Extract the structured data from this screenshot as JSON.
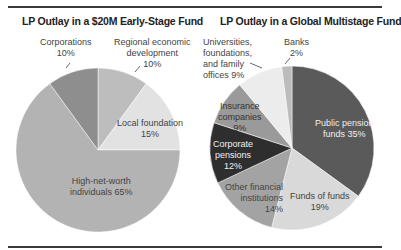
{
  "header": {
    "cut_text": ""
  },
  "chart_data": [
    {
      "type": "pie",
      "title": "LP Outlay in a $20M Early-Stage Fund",
      "categories": [
        "Regional economic development",
        "Local foundation",
        "High-net-worth individuals",
        "Corporations"
      ],
      "values": [
        10,
        15,
        65,
        10
      ],
      "colors": [
        "#bdbdbd",
        "#e2e2e2",
        "#b3b3b3",
        "#8e8e8e"
      ],
      "labels": {
        "corporations": [
          "Corporations",
          "10%"
        ],
        "regional": [
          "Regional economic",
          "development",
          "10%"
        ],
        "local": [
          "Local foundation",
          "15%"
        ],
        "hnw": [
          "High-net-worth",
          "individuals 65%"
        ]
      }
    },
    {
      "type": "pie",
      "title": "LP Outlay in a Global Multistage Fund",
      "categories": [
        "Public pension funds",
        "Funds of funds",
        "Other financial institutions",
        "Corporate pensions",
        "Insurance companies",
        "Universities, foundations, and family offices",
        "Banks"
      ],
      "values": [
        35,
        19,
        14,
        12,
        9,
        9,
        2
      ],
      "colors": [
        "#5a5a5a",
        "#d9d9d9",
        "#a3a3a3",
        "#2e2e2e",
        "#9a9a9a",
        "#ececec",
        "#bcbcbc"
      ],
      "labels": {
        "universities": [
          "Universities,",
          "foundations,",
          "and family",
          "offices 9%"
        ],
        "banks": [
          "Banks",
          "2%"
        ],
        "insurance": [
          "Insurance",
          "companies",
          "9%"
        ],
        "public": [
          "Public pension",
          "funds 35%"
        ],
        "corporate": [
          "Corporate",
          "pensions",
          "12%"
        ],
        "other": [
          "Other financial",
          "institutions",
          "14%"
        ],
        "fof": [
          "Funds of funds",
          "19%"
        ]
      }
    }
  ]
}
